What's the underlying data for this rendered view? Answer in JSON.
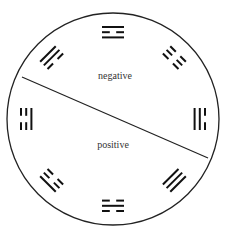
{
  "diagram": {
    "type": "trigram-circle",
    "circle": {
      "cx": 113,
      "cy": 119,
      "r": 106,
      "stroke": "#222222"
    },
    "divider": {
      "x1": 22,
      "y1": 77,
      "x2": 208,
      "y2": 158
    },
    "labels": {
      "negative": {
        "text": "negative",
        "x": 115,
        "y": 77
      },
      "positive": {
        "text": "positive",
        "x": 113,
        "y": 146
      }
    },
    "trigrams": [
      {
        "position": "top",
        "angle": 0,
        "lines_outer_to_inner": [
          "solid",
          "broken",
          "solid"
        ]
      },
      {
        "position": "top-right",
        "angle": 45,
        "lines_outer_to_inner": [
          "broken",
          "broken",
          "broken"
        ]
      },
      {
        "position": "right",
        "angle": 90,
        "lines_outer_to_inner": [
          "broken",
          "solid",
          "solid"
        ]
      },
      {
        "position": "bottom-right",
        "angle": 135,
        "lines_outer_to_inner": [
          "solid",
          "solid",
          "solid"
        ]
      },
      {
        "position": "bottom",
        "angle": 180,
        "lines_outer_to_inner": [
          "broken",
          "solid",
          "broken"
        ]
      },
      {
        "position": "bottom-left",
        "angle": 225,
        "lines_outer_to_inner": [
          "solid",
          "broken",
          "broken"
        ]
      },
      {
        "position": "left",
        "angle": 270,
        "lines_outer_to_inner": [
          "broken",
          "broken",
          "solid"
        ]
      },
      {
        "position": "top-left",
        "angle": 315,
        "lines_outer_to_inner": [
          "solid",
          "solid",
          "broken"
        ]
      }
    ]
  }
}
